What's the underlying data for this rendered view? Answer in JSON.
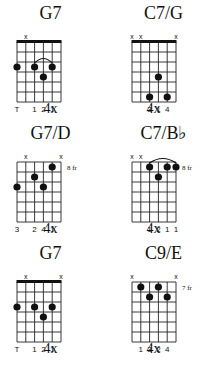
{
  "colors": {
    "ink": "#111111",
    "grid": "#222222",
    "background": "#ffffff"
  },
  "chords": [
    {
      "name": "G7",
      "repeat": "4x",
      "fret_label": "",
      "nut": true,
      "strings_muted": [
        1
      ],
      "dots": [
        [
          0,
          3
        ],
        [
          2,
          3
        ],
        [
          4,
          3
        ],
        [
          3,
          4
        ]
      ],
      "arc": [
        2,
        4,
        3
      ],
      "fingers": [
        "T",
        "",
        "1",
        "2",
        "1",
        ""
      ]
    },
    {
      "name": "C7/G",
      "repeat": "4x",
      "fret_label": "",
      "nut": true,
      "strings_muted": [
        0,
        1,
        5
      ],
      "dots": [
        [
          3,
          4
        ],
        [
          2,
          6
        ],
        [
          4,
          6
        ]
      ],
      "arc": null,
      "fingers": [
        "",
        "",
        "3",
        "1",
        "4",
        ""
      ]
    },
    {
      "name": "G7/D",
      "repeat": "4x",
      "fret_label": "8 fr",
      "nut": false,
      "strings_muted": [
        1,
        5
      ],
      "dots": [
        [
          4,
          1
        ],
        [
          2,
          2
        ],
        [
          0,
          3
        ],
        [
          3,
          3
        ]
      ],
      "arc": null,
      "fingers": [
        "3",
        "",
        "2",
        "4",
        "1",
        ""
      ]
    },
    {
      "name": "C7/B♭",
      "repeat": "4x",
      "fret_label": "8 fr",
      "nut": false,
      "strings_muted": [
        0,
        1
      ],
      "dots": [
        [
          2,
          1
        ],
        [
          4,
          1
        ],
        [
          5,
          1
        ],
        [
          3,
          2
        ]
      ],
      "arc": [
        2,
        5,
        1
      ],
      "fingers": [
        "",
        "",
        "1",
        "2",
        "1",
        "1"
      ]
    },
    {
      "name": "G7",
      "repeat": "4x",
      "fret_label": "",
      "nut": true,
      "strings_muted": [
        1,
        5
      ],
      "dots": [
        [
          0,
          3
        ],
        [
          2,
          3
        ],
        [
          4,
          3
        ],
        [
          3,
          4
        ]
      ],
      "arc": null,
      "fingers": [
        "T",
        "",
        "1",
        "2",
        "1",
        ""
      ]
    },
    {
      "name": "C9/E",
      "repeat": "4x",
      "fret_label": "7 fr",
      "nut": false,
      "strings_muted": [
        0,
        5
      ],
      "dots": [
        [
          1,
          1
        ],
        [
          3,
          1
        ],
        [
          2,
          2
        ],
        [
          4,
          2
        ]
      ],
      "arc": null,
      "fingers": [
        "",
        "1",
        "3",
        "2",
        "4",
        ""
      ]
    }
  ]
}
